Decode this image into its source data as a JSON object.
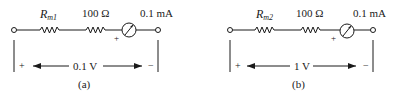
{
  "circuits": [
    {
      "id": "a",
      "caption": "(a)",
      "resistor_label_main": "R",
      "resistor_label_sub": "m1",
      "series_resistor_label": "100 Ω",
      "meter_label": "0.1 mA",
      "meter_polarity": "+",
      "voltage_label": "0.1 V",
      "plus_sign": "+",
      "minus_sign": "−"
    },
    {
      "id": "b",
      "caption": "(b)",
      "resistor_label_main": "R",
      "resistor_label_sub": "m2",
      "series_resistor_label": "100 Ω",
      "meter_label": "0.1 mA",
      "meter_polarity": "+",
      "voltage_label": "1 V",
      "plus_sign": "+",
      "minus_sign": "−"
    }
  ],
  "colors": {
    "ink": "#1a1a1a",
    "background": "#ffffff"
  }
}
